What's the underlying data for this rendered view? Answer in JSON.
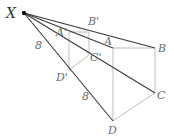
{
  "figure": {
    "center_label": "X",
    "front_labels": {
      "A": "A",
      "B": "B",
      "C": "C",
      "D": "D"
    },
    "image_labels": {
      "A": "A'",
      "B": "B'",
      "C": "C'",
      "D": "D'"
    },
    "segment_labels": [
      "8",
      "8"
    ],
    "colors": {
      "ray": "#3a3a3a",
      "edge": "#bdbdbd",
      "label": "#6b6b6b"
    }
  }
}
